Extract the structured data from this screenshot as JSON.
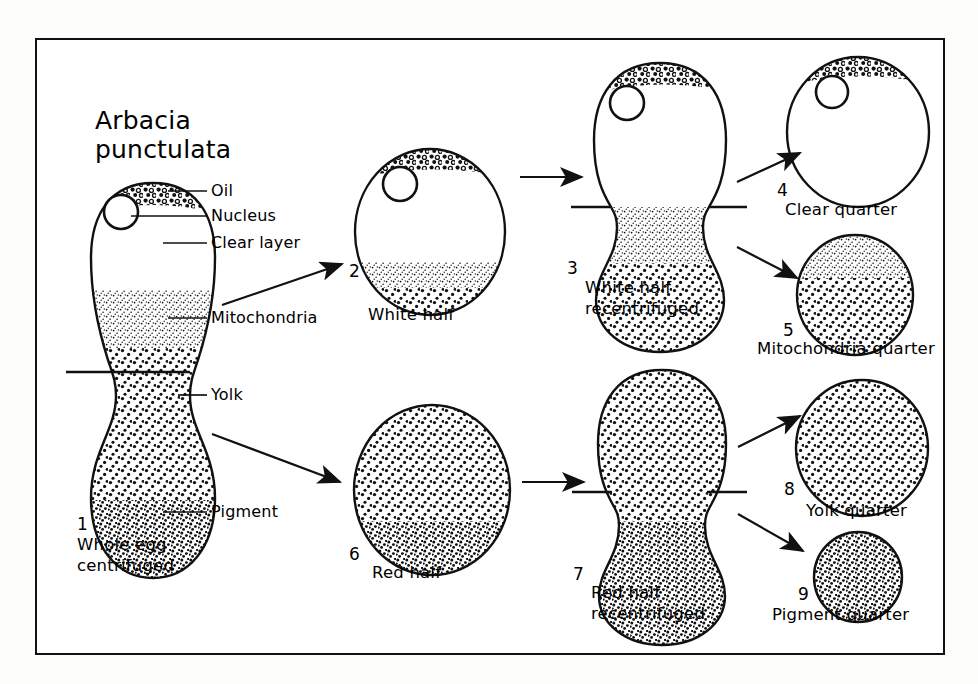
{
  "figure": {
    "title_line1": "Arbacia",
    "title_line2": "punctulata",
    "organism": "Arbacia punctulata"
  },
  "colors": {
    "ink": "#111111",
    "paper": "#ffffff",
    "page": "#fdfdfc"
  },
  "leader_labels": [
    {
      "id": "oil",
      "text": "Oil"
    },
    {
      "id": "nucleus",
      "text": "Nucleus"
    },
    {
      "id": "clear-layer",
      "text": "Clear layer"
    },
    {
      "id": "mitochondria",
      "text": "Mitochondria"
    },
    {
      "id": "yolk",
      "text": "Yolk"
    },
    {
      "id": "pigment",
      "text": "Pigment"
    }
  ],
  "stages": [
    {
      "number": "1",
      "caption_line1": "Whole egg",
      "caption_line2": "centrifuged",
      "shape": "dumbbell",
      "zones": [
        "oil",
        "nucleus",
        "clear layer",
        "mitochondria",
        "yolk",
        "pigment"
      ]
    },
    {
      "number": "2",
      "caption_line1": "White half",
      "caption_line2": "",
      "shape": "round",
      "zones": [
        "oil",
        "nucleus",
        "clear layer",
        "mitochondria"
      ]
    },
    {
      "number": "3",
      "caption_line1": "White half",
      "caption_line2": "recentrifuged",
      "shape": "dumbbell",
      "zones": [
        "oil",
        "nucleus",
        "clear layer",
        "mitochondria"
      ]
    },
    {
      "number": "4",
      "caption_line1": "Clear quarter",
      "caption_line2": "",
      "shape": "round",
      "zones": [
        "oil",
        "nucleus",
        "clear layer"
      ]
    },
    {
      "number": "5",
      "caption_line1": "Mitochondria quarter",
      "caption_line2": "",
      "shape": "round",
      "zones": [
        "mitochondria"
      ]
    },
    {
      "number": "6",
      "caption_line1": "Red half",
      "caption_line2": "",
      "shape": "round",
      "zones": [
        "yolk",
        "pigment"
      ]
    },
    {
      "number": "7",
      "caption_line1": "Red half",
      "caption_line2": "recentrifuged",
      "shape": "dumbbell",
      "zones": [
        "yolk",
        "pigment"
      ]
    },
    {
      "number": "8",
      "caption_line1": "Yolk  quarter",
      "caption_line2": "",
      "shape": "round",
      "zones": [
        "yolk"
      ]
    },
    {
      "number": "9",
      "caption_line1": "Pigment quarter",
      "caption_line2": "",
      "shape": "round",
      "zones": [
        "pigment"
      ]
    }
  ],
  "flow": [
    {
      "from": "1",
      "to": "2",
      "direction": "up-right"
    },
    {
      "from": "1",
      "to": "6",
      "direction": "down-right"
    },
    {
      "from": "2",
      "to": "3",
      "direction": "right"
    },
    {
      "from": "3",
      "to": "4",
      "direction": "up-right"
    },
    {
      "from": "3",
      "to": "5",
      "direction": "down-right"
    },
    {
      "from": "6",
      "to": "7",
      "direction": "right"
    },
    {
      "from": "7",
      "to": "8",
      "direction": "up-right"
    },
    {
      "from": "7",
      "to": "9",
      "direction": "down-right"
    }
  ],
  "cut_lines": [
    {
      "stage": "1",
      "meaning": "division into white half and red half"
    },
    {
      "stage": "3",
      "meaning": "division into clear quarter and mitochondria quarter"
    },
    {
      "stage": "7",
      "meaning": "division into yolk quarter and pigment quarter"
    }
  ]
}
